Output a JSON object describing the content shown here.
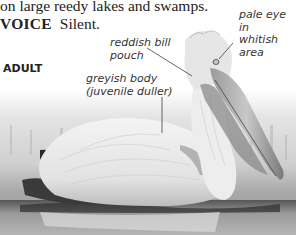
{
  "text": {
    "line1": "on large reedy lakes and swamps.",
    "voice_label": "VOICE",
    "voice_value": "Silent."
  },
  "section_heading": "ADULT",
  "annotations": [
    {
      "id": "bill-pouch",
      "lines": [
        "reddish bill",
        "pouch"
      ]
    },
    {
      "id": "eye",
      "lines": [
        "pale eye in",
        "whitish",
        "area"
      ]
    },
    {
      "id": "body",
      "lines": [
        "greyish body",
        "(juvenile duller)"
      ]
    }
  ],
  "image": {
    "subject": "Dalmatian pelican swimming (adult)",
    "style": "grayscale photo"
  }
}
